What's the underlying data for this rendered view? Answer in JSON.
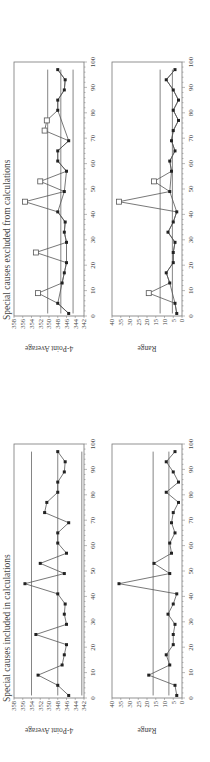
{
  "chart_data": [
    {
      "type": "line",
      "figure": "excluded",
      "title": "Special causes excluded from calculations",
      "panels": [
        {
          "name": "4-Point Average",
          "ylabel": "4-Point Average",
          "xlabel": "",
          "ylim": [
            342,
            358
          ],
          "yticks": [
            "342",
            "344",
            "346",
            "348",
            "350",
            "352",
            "354",
            "356",
            "358"
          ],
          "xlim": [
            0,
            100
          ],
          "xticks": [
            "0",
            "10",
            "20",
            "30",
            "40",
            "50",
            "60",
            "70",
            "80",
            "90",
            "100"
          ],
          "center_line": 347.3,
          "ucl": 350.3,
          "lcl": 344.5,
          "series": [
            {
              "name": "Points used (calculated)",
              "marker": "filled-square",
              "x": [
                1,
                5,
                13,
                17,
                21,
                29,
                33,
                37,
                41,
                49,
                57,
                61,
                65,
                69,
                81,
                85,
                89,
                93,
                97
              ],
              "y": [
                345.5,
                348,
                347,
                346.5,
                346,
                346,
                346.5,
                346.3,
                348,
                346.5,
                346,
                348,
                348,
                345.5,
                348,
                348,
                346.5,
                346.3,
                348
              ]
            },
            {
              "name": "Special causes (excluded)",
              "marker": "open-square",
              "x": [
                9,
                25,
                45,
                53,
                73,
                77
              ],
              "y": [
                352.5,
                353,
                355.5,
                352,
                351,
                350.5
              ]
            }
          ]
        },
        {
          "name": "Range",
          "ylabel": "Range",
          "xlabel": "",
          "ylim": [
            0,
            40
          ],
          "yticks": [
            "0",
            "5",
            "10",
            "15",
            "20",
            "25",
            "30",
            "35",
            "40"
          ],
          "xlim": [
            0,
            100
          ],
          "xticks": [
            "0",
            "10",
            "20",
            "30",
            "40",
            "50",
            "60",
            "70",
            "80",
            "90",
            "100"
          ],
          "center_line": 5.5,
          "ucl": 12.5,
          "series": [
            {
              "name": "Points used (calculated)",
              "marker": "filled-square",
              "x": [
                1,
                5,
                13,
                17,
                21,
                25,
                29,
                33,
                37,
                41,
                49,
                57,
                61,
                65,
                69,
                73,
                77,
                81,
                85,
                89,
                93,
                97
              ],
              "y": [
                3,
                4,
                7,
                9,
                5,
                5,
                4,
                8,
                5,
                3,
                7,
                6,
                7,
                4,
                6,
                5,
                2,
                5,
                2,
                5,
                9,
                4
              ]
            },
            {
              "name": "Special causes (excluded)",
              "marker": "open-square",
              "x": [
                9,
                45,
                53
              ],
              "y": [
                19,
                36,
                16
              ]
            }
          ]
        }
      ]
    },
    {
      "type": "line",
      "figure": "included",
      "title": "Special causes included in calculations",
      "panels": [
        {
          "name": "4-Point Average",
          "ylabel": "4-Point Average",
          "xlabel": "",
          "ylim": [
            342,
            358
          ],
          "yticks": [
            "342",
            "344",
            "346",
            "348",
            "350",
            "352",
            "354",
            "356",
            "358"
          ],
          "xlim": [
            0,
            100
          ],
          "xticks": [
            "0",
            "10",
            "20",
            "30",
            "40",
            "50",
            "60",
            "70",
            "80",
            "90",
            "100"
          ],
          "center_line": 348,
          "ucl": 354,
          "lcl": 342.5,
          "series": [
            {
              "name": "4-Point Average",
              "marker": "filled-square",
              "x": [
                1,
                5,
                9,
                13,
                17,
                21,
                25,
                29,
                33,
                37,
                41,
                45,
                49,
                53,
                57,
                61,
                65,
                69,
                73,
                77,
                81,
                85,
                89,
                93,
                97
              ],
              "y": [
                345.5,
                348,
                352.5,
                347,
                346.5,
                346,
                353,
                346,
                346.5,
                346.3,
                348,
                355.5,
                346.5,
                352,
                346,
                348,
                348,
                345.5,
                351,
                350.5,
                348,
                348,
                346.5,
                346.3,
                348
              ]
            }
          ]
        },
        {
          "name": "Range",
          "ylabel": "Range",
          "xlabel": "",
          "ylim": [
            0,
            40
          ],
          "yticks": [
            "0",
            "5",
            "10",
            "15",
            "20",
            "25",
            "30",
            "35",
            "40"
          ],
          "xlim": [
            0,
            100
          ],
          "xticks": [
            "0",
            "10",
            "20",
            "30",
            "40",
            "50",
            "60",
            "70",
            "80",
            "90",
            "100"
          ],
          "center_line": 7.5,
          "ucl": 16.5,
          "series": [
            {
              "name": "Range",
              "marker": "filled-square",
              "x": [
                1,
                5,
                9,
                13,
                17,
                21,
                25,
                29,
                33,
                37,
                41,
                45,
                49,
                53,
                57,
                61,
                65,
                69,
                73,
                77,
                81,
                85,
                89,
                93,
                97
              ],
              "y": [
                3,
                4,
                19,
                7,
                9,
                5,
                5,
                4,
                8,
                5,
                3,
                36,
                7,
                16,
                6,
                7,
                4,
                6,
                5,
                2,
                9,
                2,
                5,
                9,
                4
              ]
            }
          ]
        }
      ]
    }
  ]
}
